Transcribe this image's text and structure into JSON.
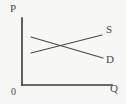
{
  "figure": {
    "background_color": "#f7f7f5",
    "width": 126,
    "height": 104
  },
  "axes": {
    "vertical": {
      "label": "P",
      "name": "price-axis",
      "color": "#3a3a3a",
      "x": 22,
      "y_top": 18,
      "y_bottom": 85
    },
    "horizontal": {
      "label": "Q",
      "name": "quantity-axis",
      "color": "#3a3a3a",
      "y": 85,
      "x_left": 22,
      "x_right": 112
    },
    "origin": {
      "label": "0"
    }
  },
  "chart_data": {
    "type": "line",
    "title": "",
    "xlabel": "Q",
    "ylabel": "P",
    "grid": false,
    "legend": "inline-end-labels",
    "xlim": [
      0,
      126
    ],
    "ylim": [
      0,
      104
    ],
    "series": [
      {
        "name": "S",
        "description": "Supply curve, upward sloping",
        "color": "#4a4a4a",
        "points": [
          [
            31,
            53
          ],
          [
            102,
            35
          ]
        ]
      },
      {
        "name": "D",
        "description": "Demand curve, downward sloping",
        "color": "#4a4a4a",
        "points": [
          [
            31,
            37
          ],
          [
            103,
            58
          ]
        ]
      }
    ],
    "intersection": [
      67,
      46
    ]
  },
  "labels": {
    "supply": "S",
    "demand": "D"
  },
  "colors": {
    "axis": "#3a3a3a",
    "curve": "#4a4a4a",
    "text": "#4a4a4a",
    "background": "#f7f7f5"
  }
}
